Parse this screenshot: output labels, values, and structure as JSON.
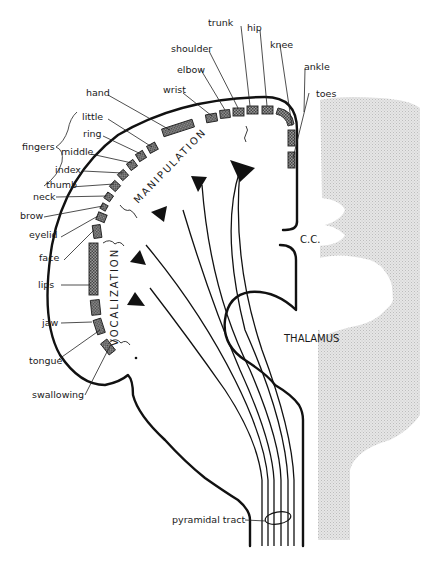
{
  "figure": {
    "type": "motor homunculus cortical map (coronal section)",
    "body_part_labels": [
      {
        "id": "toes",
        "label": "toes"
      },
      {
        "id": "ankle",
        "label": "ankle"
      },
      {
        "id": "knee",
        "label": "knee"
      },
      {
        "id": "hip",
        "label": "hip"
      },
      {
        "id": "trunk",
        "label": "trunk"
      },
      {
        "id": "shoulder",
        "label": "shoulder"
      },
      {
        "id": "elbow",
        "label": "elbow"
      },
      {
        "id": "wrist",
        "label": "wrist"
      },
      {
        "id": "hand",
        "label": "hand"
      },
      {
        "id": "little",
        "label": "little"
      },
      {
        "id": "ring",
        "label": "ring"
      },
      {
        "id": "middle",
        "label": "middle"
      },
      {
        "id": "index",
        "label": "index"
      },
      {
        "id": "thumb",
        "label": "thumb"
      },
      {
        "id": "neck",
        "label": "neck"
      },
      {
        "id": "brow",
        "label": "brow"
      },
      {
        "id": "eyelid",
        "label": "eyelid"
      },
      {
        "id": "face",
        "label": "face"
      },
      {
        "id": "lips",
        "label": "lips"
      },
      {
        "id": "jaw",
        "label": "jaw"
      },
      {
        "id": "tongue",
        "label": "tongue"
      },
      {
        "id": "swallowing",
        "label": "swallowing"
      }
    ],
    "group_labels": {
      "fingers": "fingers"
    },
    "region_labels": {
      "manipulation": "MANIPULATION",
      "vocalization": "VOCALIZATION"
    },
    "structure_labels": {
      "corpus_callosum": "C.C.",
      "thalamus": "THALAMUS",
      "pyramidal_tract": "pyramidal tract"
    },
    "colors": {
      "ink": "#111111",
      "stipple_background": "#d9d9d9",
      "paper": "#ffffff"
    }
  }
}
